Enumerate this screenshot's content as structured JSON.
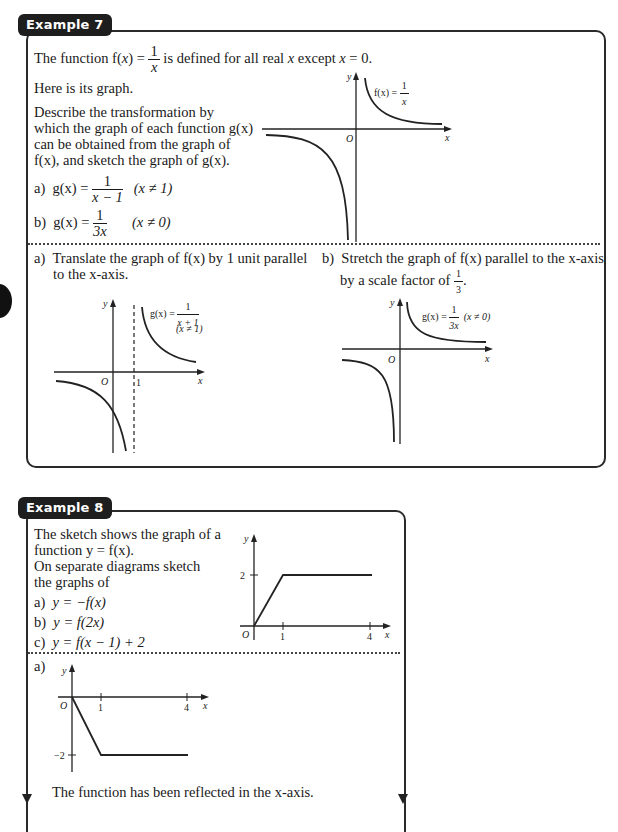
{
  "example7": {
    "tab_label": "Example 7",
    "intro": {
      "prefix": "The function f(",
      "var": "x",
      "mid": ") = ",
      "frac_num": "1",
      "frac_den": "x",
      "suffix_a": " is defined for all real ",
      "suffix_x": "x",
      "suffix_b": " except ",
      "suffix_x2": "x",
      "suffix_c": " = 0."
    },
    "here_graph": "Here is its graph.",
    "describe_lines": [
      "Describe the transformation by",
      "which the graph of each function g(x)",
      "can be obtained from the graph of",
      "f(x), and sketch the graph of g(x)."
    ],
    "parts": [
      {
        "label": "a)",
        "lhs": "g(x) =",
        "num": "1",
        "den": "x − 1",
        "cond": "(x ≠ 1)"
      },
      {
        "label": "b)",
        "lhs": "g(x) =",
        "num": "1",
        "den": "3x",
        "cond": "(x ≠ 0)"
      }
    ],
    "main_graph": {
      "label_lhs": "f(x) =",
      "label_num": "1",
      "label_den": "x",
      "origin": "O",
      "x_axis": "x",
      "y_axis": "y"
    },
    "solution_a": {
      "label": "a)",
      "lines": [
        "Translate the graph of f(x) by 1 unit parallel",
        "to the x-axis."
      ],
      "graph": {
        "label_lhs": "g(x) =",
        "label_num": "1",
        "label_den": "x + 1",
        "cond": "(x ≠ 1)",
        "origin": "O",
        "tick": "1",
        "x_axis": "x",
        "y_axis": "y"
      }
    },
    "solution_b": {
      "label": "b)",
      "lines": [
        "Stretch the graph of f(x) parallel to the x-axis",
        "by a scale factor of"
      ],
      "scale_num": "1",
      "scale_den": "3",
      "graph": {
        "label_lhs": "g(x) =",
        "label_num": "1",
        "label_den": "3x",
        "cond": "(x ≠ 0)",
        "origin": "O",
        "x_axis": "x",
        "y_axis": "y"
      }
    }
  },
  "example8": {
    "tab_label": "Example 8",
    "lines": [
      "The sketch shows the graph of a",
      "function  y = f(x).",
      "On separate diagrams sketch",
      "the graphs of"
    ],
    "parts": [
      {
        "label": "a)",
        "expr": "y = −f(x)"
      },
      {
        "label": "b)",
        "expr": "y = f(2x)"
      },
      {
        "label": "c)",
        "expr": "y = f(x − 1) + 2"
      }
    ],
    "graph": {
      "y_tick": "2",
      "x_ticks": [
        "1",
        "4"
      ],
      "origin": "O",
      "x_axis": "x",
      "y_axis": "y"
    },
    "solution_a": {
      "label": "a)",
      "graph": {
        "y_tick": "−2",
        "x_ticks": [
          "1",
          "4"
        ],
        "origin": "O",
        "x_axis": "x",
        "y_axis": "y"
      },
      "conclusion": "The function has been reflected in the x-axis."
    }
  }
}
